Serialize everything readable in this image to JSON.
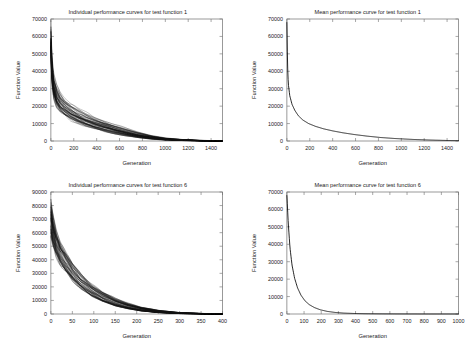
{
  "figure": {
    "background": "#ffffff",
    "axis_color": "#6e6e6e",
    "curve_color": "#000000"
  },
  "panels": [
    {
      "id": "top-left",
      "title": "Individual performance curves for test function 1",
      "xlabel": "Generation",
      "ylabel": "Function Value"
    },
    {
      "id": "top-right",
      "title": "Mean performance curve for test function 1",
      "xlabel": "Generation",
      "ylabel": "Function Value"
    },
    {
      "id": "bottom-left",
      "title": "Individual performance curves for test function 6",
      "xlabel": "Generation",
      "ylabel": "Function Value"
    },
    {
      "id": "bottom-right",
      "title": "Mean performance curve for test function 6",
      "xlabel": "Generation",
      "ylabel": "Function Value"
    }
  ],
  "chart_data": [
    {
      "type": "line",
      "id": "top-left",
      "title": "Individual performance curves for test function 1",
      "xlabel": "Generation",
      "ylabel": "Function Value",
      "xlim": [
        0,
        1500
      ],
      "ylim": [
        0,
        70000
      ],
      "xticks": [
        0,
        200,
        400,
        600,
        800,
        1000,
        1200,
        1400
      ],
      "yticks": [
        0,
        10000,
        20000,
        30000,
        40000,
        50000,
        60000,
        70000
      ],
      "grid": false,
      "legend": "none",
      "note": "Bundle of ~50 individual runs, all monotonically decreasing from a spread of 48000-66000 at generation 0 to near 0 by generation 900-1100.",
      "series": [
        {
          "name": "run-envelope-upper",
          "x": [
            0,
            10,
            25,
            50,
            80,
            120,
            170,
            230,
            300,
            380,
            470,
            560,
            650,
            760,
            880,
            1000,
            1150,
            1300,
            1500
          ],
          "values": [
            66000,
            47000,
            38000,
            32000,
            28000,
            24500,
            21500,
            19000,
            16500,
            14000,
            11500,
            9500,
            7500,
            5200,
            3200,
            1800,
            900,
            400,
            150
          ]
        },
        {
          "name": "run-envelope-median",
          "x": [
            0,
            10,
            25,
            50,
            80,
            120,
            170,
            230,
            300,
            380,
            470,
            560,
            650,
            760,
            880,
            1000,
            1150,
            1300,
            1500
          ],
          "values": [
            57000,
            40000,
            31000,
            25500,
            22000,
            19000,
            16500,
            14200,
            12000,
            10000,
            8200,
            6500,
            5000,
            3400,
            2000,
            1100,
            520,
            220,
            80
          ]
        },
        {
          "name": "run-envelope-lower",
          "x": [
            0,
            10,
            25,
            50,
            80,
            120,
            170,
            230,
            300,
            380,
            470,
            560,
            650,
            760,
            880,
            1000,
            1150,
            1300,
            1500
          ],
          "values": [
            48000,
            33000,
            25000,
            20000,
            17000,
            14500,
            12200,
            10200,
            8400,
            6800,
            5300,
            4000,
            2900,
            1800,
            1000,
            500,
            220,
            90,
            30
          ]
        }
      ]
    },
    {
      "type": "line",
      "id": "top-right",
      "title": "Mean performance curve for test function 1",
      "xlabel": "Generation",
      "ylabel": "Function Value",
      "xlim": [
        0,
        1500
      ],
      "ylim": [
        0,
        70000
      ],
      "xticks": [
        0,
        200,
        400,
        600,
        800,
        1000,
        1200,
        1400
      ],
      "yticks": [
        0,
        10000,
        20000,
        30000,
        40000,
        50000,
        60000,
        70000
      ],
      "grid": false,
      "legend": "none",
      "series": [
        {
          "name": "mean",
          "x": [
            0,
            5,
            12,
            25,
            45,
            70,
            100,
            140,
            190,
            250,
            320,
            400,
            490,
            590,
            700,
            820,
            950,
            1100,
            1250,
            1400,
            1500
          ],
          "values": [
            68000,
            45000,
            33000,
            26000,
            21000,
            17500,
            14500,
            12000,
            10000,
            8400,
            7000,
            5800,
            4700,
            3700,
            2800,
            2000,
            1400,
            900,
            550,
            300,
            200
          ]
        }
      ]
    },
    {
      "type": "line",
      "id": "bottom-left",
      "title": "Individual performance curves for test function 6",
      "xlabel": "Generation",
      "ylabel": "Function Value",
      "xlim": [
        0,
        400
      ],
      "ylim": [
        0,
        90000
      ],
      "xticks": [
        0,
        50,
        100,
        150,
        200,
        250,
        300,
        350,
        400
      ],
      "yticks": [
        0,
        10000,
        20000,
        30000,
        40000,
        50000,
        60000,
        70000,
        80000,
        90000
      ],
      "grid": false,
      "legend": "none",
      "note": "Bundle of ~50 individual runs descending from 60000-82000 at generation 0 to near 0 by generation 230-300.",
      "series": [
        {
          "name": "run-envelope-upper",
          "x": [
            0,
            5,
            12,
            22,
            35,
            50,
            70,
            95,
            120,
            150,
            180,
            210,
            250,
            300,
            350,
            400
          ],
          "values": [
            82000,
            72000,
            62000,
            53000,
            45000,
            37000,
            29000,
            22000,
            16500,
            11500,
            8000,
            5200,
            2800,
            1100,
            450,
            200
          ]
        },
        {
          "name": "run-envelope-median",
          "x": [
            0,
            5,
            12,
            22,
            35,
            50,
            70,
            95,
            120,
            150,
            180,
            210,
            250,
            300,
            350,
            400
          ],
          "values": [
            72000,
            62000,
            53000,
            45000,
            38000,
            31000,
            24000,
            17500,
            12800,
            8600,
            5600,
            3500,
            1700,
            600,
            220,
            90
          ]
        },
        {
          "name": "run-envelope-lower",
          "x": [
            0,
            5,
            12,
            22,
            35,
            50,
            70,
            95,
            120,
            150,
            180,
            210,
            250,
            300,
            350,
            400
          ],
          "values": [
            60000,
            52000,
            44000,
            37000,
            31000,
            25000,
            19000,
            13500,
            9500,
            6000,
            3800,
            2200,
            1000,
            300,
            100,
            40
          ]
        }
      ]
    },
    {
      "type": "line",
      "id": "bottom-right",
      "title": "Mean performance curve for test function 6",
      "xlabel": "Generation",
      "ylabel": "Function Value",
      "xlim": [
        0,
        1000
      ],
      "ylim": [
        0,
        70000
      ],
      "xticks": [
        0,
        100,
        200,
        300,
        400,
        500,
        600,
        700,
        800,
        900,
        1000
      ],
      "yticks": [
        0,
        10000,
        20000,
        30000,
        40000,
        50000,
        60000,
        70000
      ],
      "grid": false,
      "legend": "none",
      "series": [
        {
          "name": "mean",
          "x": [
            0,
            8,
            18,
            30,
            45,
            62,
            82,
            105,
            130,
            160,
            195,
            235,
            280,
            330,
            390,
            460,
            540,
            640,
            760,
            880,
            1000
          ],
          "values": [
            68000,
            52000,
            38000,
            28000,
            20500,
            15000,
            10800,
            7600,
            5400,
            3700,
            2400,
            1500,
            900,
            520,
            300,
            170,
            95,
            50,
            25,
            12,
            6
          ]
        }
      ]
    }
  ]
}
